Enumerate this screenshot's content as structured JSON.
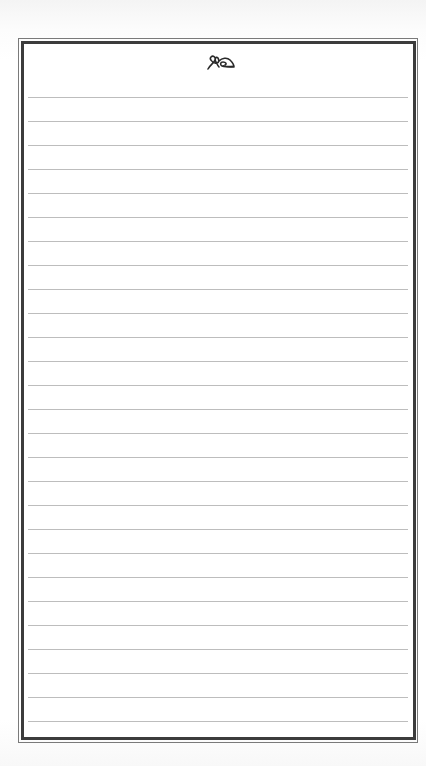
{
  "document": {
    "type": "lined-notepaper",
    "ornament": {
      "icon": "fleuron-ornament-icon",
      "color": "#2a2a2a"
    },
    "frame": {
      "outer_color": "#7a7a7a",
      "inner_color": "#3c3c3c"
    },
    "ruled_lines": {
      "count": 27,
      "first_y": 97,
      "spacing": 24,
      "color": "#bdbdbd"
    }
  }
}
